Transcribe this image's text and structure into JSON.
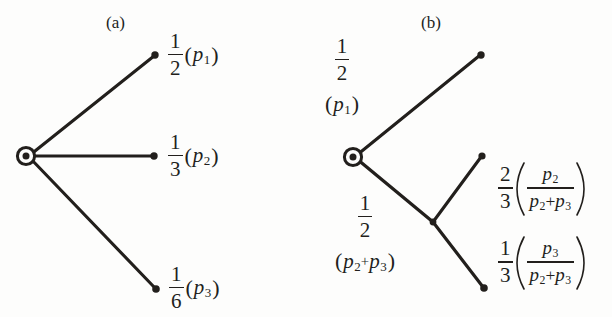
{
  "figure": {
    "background": "#fdfdfc",
    "ink": "#221f1c",
    "panels": [
      {
        "id": "a",
        "title": "(a)",
        "root_node": "root-node-a",
        "branches": [
          {
            "id": "branch-a-1",
            "probability": {
              "num": "1",
              "den": "2"
            },
            "event": {
              "open": "(",
              "symbol": "p",
              "sub": "1",
              "close": ")"
            },
            "label_text": "1/2 (p1)"
          },
          {
            "id": "branch-a-2",
            "probability": {
              "num": "1",
              "den": "3"
            },
            "event": {
              "open": "(",
              "symbol": "p",
              "sub": "2",
              "close": ")"
            },
            "label_text": "1/3 (p2)"
          },
          {
            "id": "branch-a-3",
            "probability": {
              "num": "1",
              "den": "6"
            },
            "event": {
              "open": "(",
              "symbol": "p",
              "sub": "3",
              "close": ")"
            },
            "label_text": "1/6 (p3)"
          }
        ]
      },
      {
        "id": "b",
        "title": "(b)",
        "root_node": "root-node-b",
        "branches": [
          {
            "id": "branch-b-1",
            "probability": {
              "num": "1",
              "den": "2"
            },
            "event": {
              "open": "(",
              "symbol": "p",
              "sub": "1",
              "close": ")"
            },
            "label_text": "1/2 (p1)"
          },
          {
            "id": "branch-b-2",
            "probability": {
              "num": "1",
              "den": "2"
            },
            "event": {
              "open": "(",
              "symbol_1": "p",
              "sub_1": "2",
              "plus": "+",
              "symbol_2": "p",
              "sub_2": "3",
              "close": ")"
            },
            "label_text": "1/2 (p2+p3)"
          },
          {
            "id": "branch-b-3",
            "probability": {
              "num": "2",
              "den": "3"
            },
            "event": {
              "open": "(",
              "numerator": {
                "symbol": "p",
                "sub": "2"
              },
              "denominator": {
                "symbol_1": "p",
                "sub_1": "2",
                "plus": "+",
                "symbol_2": "p",
                "sub_2": "3"
              },
              "close": ")"
            },
            "label_text": "2/3 (p2/(p2+p3))"
          },
          {
            "id": "branch-b-4",
            "probability": {
              "num": "1",
              "den": "3"
            },
            "event": {
              "open": "(",
              "numerator": {
                "symbol": "p",
                "sub": "3"
              },
              "denominator": {
                "symbol_1": "p",
                "sub_1": "2",
                "plus": "+",
                "symbol_2": "p",
                "sub_2": "3"
              },
              "close": ")"
            },
            "label_text": "1/3 (p3/(p2+p3))"
          }
        ]
      }
    ]
  }
}
